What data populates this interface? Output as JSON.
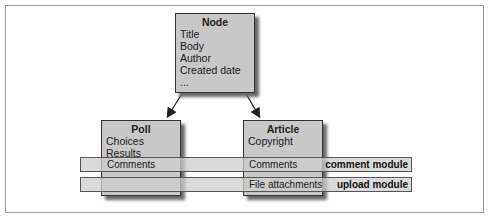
{
  "diagram": {
    "node": {
      "title": "Node",
      "fields": [
        "Title",
        "Body",
        "Author",
        "Created date",
        "..."
      ]
    },
    "poll": {
      "title": "Poll",
      "fields": [
        "Choices",
        "Results"
      ]
    },
    "article": {
      "title": "Article",
      "fields": [
        "Copyright"
      ]
    },
    "bands": [
      {
        "label": "comment module",
        "poll_cell": "Comments",
        "article_cell": "Comments"
      },
      {
        "label": "upload module",
        "poll_cell": "",
        "article_cell": "File attachments"
      }
    ],
    "edges": [
      {
        "from": "Node",
        "to": "Poll"
      },
      {
        "from": "Node",
        "to": "Article"
      }
    ]
  }
}
